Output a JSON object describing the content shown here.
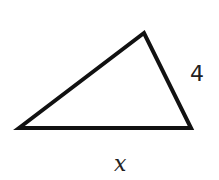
{
  "diagram": {
    "type": "triangle",
    "vertices": [
      [
        19,
        128
      ],
      [
        144,
        33
      ],
      [
        191,
        128
      ]
    ],
    "stroke_color": "#111111",
    "stroke_width": 4,
    "fill": "#ffffff",
    "labels": {
      "right_side": "4",
      "base": "x"
    }
  }
}
